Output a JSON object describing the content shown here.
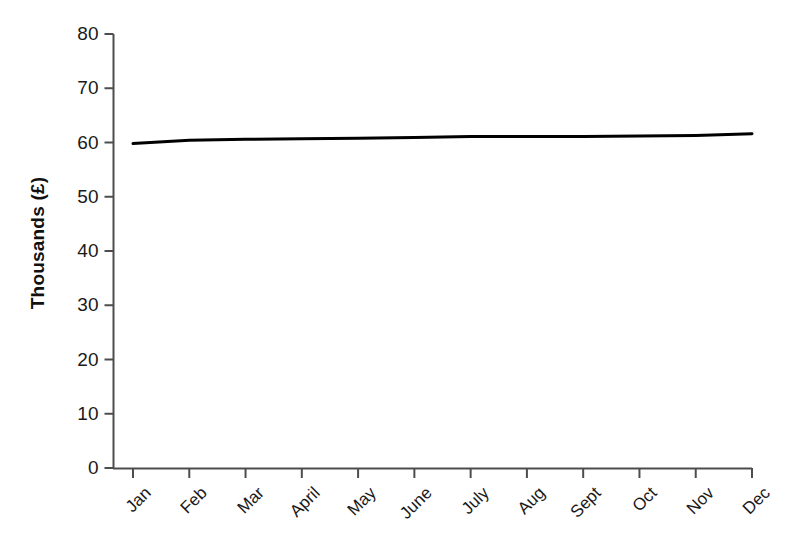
{
  "chart_data": {
    "type": "line",
    "title": "",
    "subtitle": "",
    "xlabel": "",
    "ylabel": "Thousands (£)",
    "categories": [
      "Jan",
      "Feb",
      "Mar",
      "April",
      "May",
      "June",
      "July",
      "Aug",
      "Sept",
      "Oct",
      "Nov",
      "Dec"
    ],
    "values": [
      59.8,
      60.4,
      60.6,
      60.7,
      60.8,
      60.9,
      61.1,
      61.1,
      61.1,
      61.2,
      61.3,
      61.6
    ],
    "series": [
      {
        "name": "",
        "values": [
          59.8,
          60.4,
          60.6,
          60.7,
          60.8,
          60.9,
          61.1,
          61.1,
          61.1,
          61.2,
          61.3,
          61.6
        ]
      }
    ],
    "ylim": [
      0,
      80
    ],
    "y_ticks": [
      0,
      10,
      20,
      30,
      40,
      50,
      60,
      70,
      80
    ],
    "y_tick_labels": [
      "0",
      "10",
      "20",
      "30",
      "40",
      "50",
      "60",
      "70",
      "80"
    ],
    "x_tick_labels": [
      "Jan",
      "Feb",
      "Mar",
      "April",
      "May",
      "June",
      "July",
      "Aug",
      "Sept",
      "Oct",
      "Nov",
      "Dec"
    ],
    "grid": false,
    "legend": false,
    "legend_position": "none",
    "line_color": "#000000",
    "line_width": 3,
    "axis_color": "#4d4d4d",
    "background_color": "#ffffff",
    "x_tick_rotation": -45,
    "annotations": []
  }
}
